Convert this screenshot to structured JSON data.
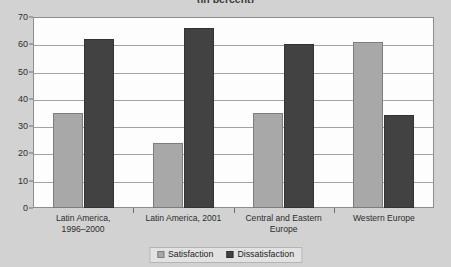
{
  "chart_data": {
    "type": "bar",
    "title": "(in percent)",
    "xlabel": "",
    "ylabel": "",
    "ylim": [
      0,
      70
    ],
    "ytick_step": 10,
    "yticks": [
      "0",
      "10",
      "20",
      "30",
      "40",
      "50",
      "60",
      "70"
    ],
    "grid": true,
    "legend_position": "bottom",
    "categories": [
      "Latin America, 1996–2000",
      "Latin America, 2001",
      "Central and Eastern Europe",
      "Western Europe"
    ],
    "category_lines": [
      [
        "Latin America,",
        "1996–2000"
      ],
      [
        "Latin America, 2001"
      ],
      [
        "Central and Eastern",
        "Europe"
      ],
      [
        "Western Europe"
      ]
    ],
    "series": [
      {
        "name": "Satisfaction",
        "color": "#a8a8a8",
        "values": [
          35,
          24,
          35,
          61
        ]
      },
      {
        "name": "Dissatisfaction",
        "color": "#424242",
        "values": [
          62,
          66,
          60,
          34
        ]
      }
    ]
  },
  "colors": {
    "background": "#d2d2d2",
    "plot_background": "#fdfdfd",
    "gridline": "#a3a3a3",
    "axis": "#8d8d8d",
    "satisfaction": "#a8a8a8",
    "dissatisfaction": "#424242",
    "text": "#2c2c2c"
  }
}
